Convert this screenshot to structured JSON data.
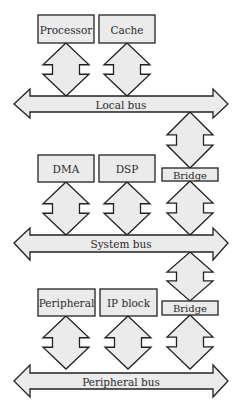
{
  "colors": {
    "fill": "#ebebeb",
    "stroke": "#222222",
    "text": "#2a2a2a",
    "background": "#ffffff"
  },
  "buses": [
    {
      "id": "local-bus",
      "label": "Local bus",
      "tipY": 104,
      "shaftTop": 96,
      "shaftBottom": 112,
      "headTop": 89,
      "headBottom": 118,
      "leftTip": 14,
      "leftBase": 30,
      "rightBase": 213,
      "rightTip": 228
    },
    {
      "id": "system-bus",
      "label": "System bus",
      "tipY": 243,
      "shaftTop": 235,
      "shaftBottom": 252,
      "headTop": 228,
      "headBottom": 260,
      "leftTip": 14,
      "leftBase": 30,
      "rightBase": 213,
      "rightTip": 228
    },
    {
      "id": "peripheral-bus",
      "label": "Peripheral bus",
      "tipY": 381,
      "shaftTop": 373,
      "shaftBottom": 389,
      "headTop": 365,
      "headBottom": 397,
      "leftTip": 14,
      "leftBase": 30,
      "rightBase": 213,
      "rightTip": 228
    }
  ],
  "blocks": [
    {
      "id": "processor",
      "label": "Processor",
      "x": 38,
      "y": 15,
      "w": 56,
      "h": 28
    },
    {
      "id": "cache",
      "label": "Cache",
      "x": 99,
      "y": 15,
      "w": 56,
      "h": 28
    },
    {
      "id": "dma",
      "label": "DMA",
      "x": 38,
      "y": 155,
      "w": 56,
      "h": 27
    },
    {
      "id": "dsp",
      "label": "DSP",
      "x": 99,
      "y": 155,
      "w": 56,
      "h": 27
    },
    {
      "id": "bridge-1",
      "label": "Bridge",
      "x": 162,
      "y": 168,
      "w": 56,
      "h": 13
    },
    {
      "id": "peripheral",
      "label": "Peripheral",
      "x": 38,
      "y": 289,
      "w": 57,
      "h": 27
    },
    {
      "id": "ip-block",
      "label": "IP block",
      "x": 100,
      "y": 289,
      "w": 57,
      "h": 27
    },
    {
      "id": "bridge-2",
      "label": "Bridge",
      "x": 162,
      "y": 301,
      "w": 56,
      "h": 14
    }
  ],
  "connectors": [
    {
      "id": "processor-to-local-bus",
      "cx": 66,
      "top": 43,
      "bottom": 96
    },
    {
      "id": "cache-to-local-bus",
      "cx": 127,
      "top": 43,
      "bottom": 96
    },
    {
      "id": "local-bus-to-bridge-1",
      "cx": 190,
      "top": 112,
      "bottom": 168
    },
    {
      "id": "dma-to-system-bus",
      "cx": 66,
      "top": 182,
      "bottom": 235
    },
    {
      "id": "dsp-to-system-bus",
      "cx": 127,
      "top": 182,
      "bottom": 235
    },
    {
      "id": "bridge-1-to-system-bus",
      "cx": 190,
      "top": 181,
      "bottom": 235
    },
    {
      "id": "system-bus-to-bridge-2",
      "cx": 190,
      "top": 252,
      "bottom": 301
    },
    {
      "id": "peripheral-to-peripheral-bus",
      "cx": 66,
      "top": 316,
      "bottom": 369
    },
    {
      "id": "ip-block-to-peripheral-bus",
      "cx": 128,
      "top": 316,
      "bottom": 369
    },
    {
      "id": "bridge-2-to-peripheral-bus",
      "cx": 190,
      "top": 315,
      "bottom": 369
    }
  ]
}
